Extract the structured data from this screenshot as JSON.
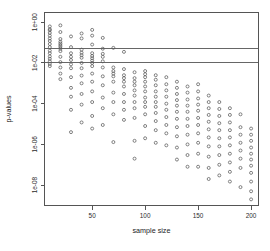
{
  "chart_data": {
    "type": "scatter",
    "title": "",
    "xlabel": "sample size",
    "ylabel": "p-values",
    "yscale": "log",
    "xlim": [
      5,
      207
    ],
    "ylim": [
      1e-09,
      3.0
    ],
    "grid": false,
    "legend": null,
    "xticks": [
      50,
      100,
      150,
      200
    ],
    "xtick_labels": [
      "50",
      "100",
      "150",
      "200"
    ],
    "yticks": [
      1,
      0.01,
      0.0001,
      1e-06,
      1e-08
    ],
    "ytick_labels": [
      "1e+00",
      "1e-02",
      "1e-04",
      "1e-06",
      "1e-08"
    ],
    "reference_lines": [
      {
        "y": 0.05,
        "label": "",
        "orientation": "horizontal"
      },
      {
        "y": 0.01,
        "label": "",
        "orientation": "horizontal"
      }
    ],
    "marker": {
      "shape": "open-circle",
      "size": 3
    },
    "points": [
      {
        "x": 10,
        "y": 0.62
      },
      {
        "x": 10,
        "y": 0.45
      },
      {
        "x": 10,
        "y": 0.4
      },
      {
        "x": 10,
        "y": 0.3
      },
      {
        "x": 10,
        "y": 0.22
      },
      {
        "x": 10,
        "y": 0.16
      },
      {
        "x": 10,
        "y": 0.12
      },
      {
        "x": 10,
        "y": 0.085
      },
      {
        "x": 10,
        "y": 0.06
      },
      {
        "x": 10,
        "y": 0.04
      },
      {
        "x": 10,
        "y": 0.03
      },
      {
        "x": 10,
        "y": 0.021
      },
      {
        "x": 10,
        "y": 0.016
      },
      {
        "x": 10,
        "y": 0.012
      },
      {
        "x": 10,
        "y": 0.009
      },
      {
        "x": 10,
        "y": 0.007
      },
      {
        "x": 20,
        "y": 0.7
      },
      {
        "x": 20,
        "y": 0.33
      },
      {
        "x": 20,
        "y": 0.15
      },
      {
        "x": 20,
        "y": 0.11
      },
      {
        "x": 20,
        "y": 0.09
      },
      {
        "x": 20,
        "y": 0.075
      },
      {
        "x": 20,
        "y": 0.062
      },
      {
        "x": 20,
        "y": 0.05
      },
      {
        "x": 20,
        "y": 0.038
      },
      {
        "x": 20,
        "y": 0.02
      },
      {
        "x": 20,
        "y": 0.011
      },
      {
        "x": 20,
        "y": 0.006
      },
      {
        "x": 20,
        "y": 0.003
      },
      {
        "x": 20,
        "y": 0.0016
      },
      {
        "x": 30,
        "y": 0.2
      },
      {
        "x": 30,
        "y": 0.06
      },
      {
        "x": 30,
        "y": 0.03
      },
      {
        "x": 30,
        "y": 0.02
      },
      {
        "x": 30,
        "y": 0.014
      },
      {
        "x": 30,
        "y": 0.0085
      },
      {
        "x": 30,
        "y": 0.0055
      },
      {
        "x": 30,
        "y": 0.002
      },
      {
        "x": 30,
        "y": 0.0006
      },
      {
        "x": 30,
        "y": 0.00022
      },
      {
        "x": 30,
        "y": 5e-05
      },
      {
        "x": 30,
        "y": 4e-06
      },
      {
        "x": 40,
        "y": 0.28
      },
      {
        "x": 40,
        "y": 0.16
      },
      {
        "x": 40,
        "y": 0.045
      },
      {
        "x": 40,
        "y": 0.032
      },
      {
        "x": 40,
        "y": 0.024
      },
      {
        "x": 40,
        "y": 0.018
      },
      {
        "x": 40,
        "y": 0.01
      },
      {
        "x": 40,
        "y": 0.0055
      },
      {
        "x": 40,
        "y": 0.0024
      },
      {
        "x": 40,
        "y": 0.001
      },
      {
        "x": 40,
        "y": 0.0003
      },
      {
        "x": 40,
        "y": 9e-05
      },
      {
        "x": 40,
        "y": 1.2e-05
      },
      {
        "x": 50,
        "y": 0.42
      },
      {
        "x": 50,
        "y": 0.22
      },
      {
        "x": 50,
        "y": 0.08
      },
      {
        "x": 50,
        "y": 0.03
      },
      {
        "x": 50,
        "y": 0.022
      },
      {
        "x": 50,
        "y": 0.017
      },
      {
        "x": 50,
        "y": 0.013
      },
      {
        "x": 50,
        "y": 0.01
      },
      {
        "x": 50,
        "y": 0.007
      },
      {
        "x": 50,
        "y": 0.003
      },
      {
        "x": 50,
        "y": 0.0012
      },
      {
        "x": 50,
        "y": 0.0004
      },
      {
        "x": 50,
        "y": 0.00012
      },
      {
        "x": 50,
        "y": 2.5e-05
      },
      {
        "x": 50,
        "y": 6e-06
      },
      {
        "x": 60,
        "y": 0.17
      },
      {
        "x": 60,
        "y": 0.05
      },
      {
        "x": 60,
        "y": 0.028
      },
      {
        "x": 60,
        "y": 0.02
      },
      {
        "x": 60,
        "y": 0.012
      },
      {
        "x": 60,
        "y": 0.006
      },
      {
        "x": 60,
        "y": 0.0022
      },
      {
        "x": 60,
        "y": 0.0008
      },
      {
        "x": 60,
        "y": 0.0002
      },
      {
        "x": 60,
        "y": 6e-05
      },
      {
        "x": 60,
        "y": 9e-06
      },
      {
        "x": 70,
        "y": 0.055
      },
      {
        "x": 70,
        "y": 0.006
      },
      {
        "x": 70,
        "y": 0.004
      },
      {
        "x": 70,
        "y": 0.003
      },
      {
        "x": 70,
        "y": 0.0022
      },
      {
        "x": 70,
        "y": 0.0012
      },
      {
        "x": 70,
        "y": 0.00035
      },
      {
        "x": 70,
        "y": 0.00012
      },
      {
        "x": 70,
        "y": 3e-05
      },
      {
        "x": 70,
        "y": 1.3e-06
      },
      {
        "x": 80,
        "y": 0.035
      },
      {
        "x": 80,
        "y": 0.005
      },
      {
        "x": 80,
        "y": 0.0025
      },
      {
        "x": 80,
        "y": 0.0018
      },
      {
        "x": 80,
        "y": 0.0012
      },
      {
        "x": 80,
        "y": 0.0007
      },
      {
        "x": 80,
        "y": 0.0003
      },
      {
        "x": 80,
        "y": 0.00012
      },
      {
        "x": 80,
        "y": 5e-05
      },
      {
        "x": 80,
        "y": 1.6e-05
      },
      {
        "x": 90,
        "y": 0.0035
      },
      {
        "x": 90,
        "y": 0.0018
      },
      {
        "x": 90,
        "y": 0.0012
      },
      {
        "x": 90,
        "y": 0.0008
      },
      {
        "x": 90,
        "y": 0.00045
      },
      {
        "x": 90,
        "y": 0.00025
      },
      {
        "x": 90,
        "y": 0.00012
      },
      {
        "x": 90,
        "y": 6e-05
      },
      {
        "x": 90,
        "y": 2e-05
      },
      {
        "x": 90,
        "y": 1.5e-06
      },
      {
        "x": 90,
        "y": 2e-07
      },
      {
        "x": 100,
        "y": 0.004
      },
      {
        "x": 100,
        "y": 0.0028
      },
      {
        "x": 100,
        "y": 0.002
      },
      {
        "x": 100,
        "y": 0.0012
      },
      {
        "x": 100,
        "y": 0.0007
      },
      {
        "x": 100,
        "y": 0.0004
      },
      {
        "x": 100,
        "y": 0.0002
      },
      {
        "x": 100,
        "y": 0.00012
      },
      {
        "x": 100,
        "y": 7e-05
      },
      {
        "x": 100,
        "y": 3e-05
      },
      {
        "x": 100,
        "y": 8e-06
      },
      {
        "x": 100,
        "y": 2e-06
      },
      {
        "x": 110,
        "y": 0.0025
      },
      {
        "x": 110,
        "y": 0.0015
      },
      {
        "x": 110,
        "y": 0.0008
      },
      {
        "x": 110,
        "y": 0.0004
      },
      {
        "x": 110,
        "y": 0.00022
      },
      {
        "x": 110,
        "y": 0.00012
      },
      {
        "x": 110,
        "y": 7e-05
      },
      {
        "x": 110,
        "y": 3.5e-05
      },
      {
        "x": 110,
        "y": 1.4e-05
      },
      {
        "x": 110,
        "y": 5e-06
      },
      {
        "x": 110,
        "y": 1.2e-06
      },
      {
        "x": 120,
        "y": 0.002
      },
      {
        "x": 120,
        "y": 0.0009
      },
      {
        "x": 120,
        "y": 0.00045
      },
      {
        "x": 120,
        "y": 0.00022
      },
      {
        "x": 120,
        "y": 0.0001
      },
      {
        "x": 120,
        "y": 5e-05
      },
      {
        "x": 120,
        "y": 2.2e-05
      },
      {
        "x": 120,
        "y": 9e-06
      },
      {
        "x": 120,
        "y": 3.5e-06
      },
      {
        "x": 120,
        "y": 9e-07
      },
      {
        "x": 130,
        "y": 0.0012
      },
      {
        "x": 130,
        "y": 0.0006
      },
      {
        "x": 130,
        "y": 0.0003
      },
      {
        "x": 130,
        "y": 0.00015
      },
      {
        "x": 130,
        "y": 8e-05
      },
      {
        "x": 130,
        "y": 4e-05
      },
      {
        "x": 130,
        "y": 1.8e-05
      },
      {
        "x": 130,
        "y": 7e-06
      },
      {
        "x": 130,
        "y": 2.5e-06
      },
      {
        "x": 130,
        "y": 7e-07
      },
      {
        "x": 130,
        "y": 1.8e-07
      },
      {
        "x": 140,
        "y": 0.0007
      },
      {
        "x": 140,
        "y": 0.00035
      },
      {
        "x": 140,
        "y": 0.00016
      },
      {
        "x": 140,
        "y": 8e-05
      },
      {
        "x": 140,
        "y": 4e-05
      },
      {
        "x": 140,
        "y": 1.8e-05
      },
      {
        "x": 140,
        "y": 8e-06
      },
      {
        "x": 140,
        "y": 3e-06
      },
      {
        "x": 140,
        "y": 1e-06
      },
      {
        "x": 140,
        "y": 3e-07
      },
      {
        "x": 140,
        "y": 8e-08
      },
      {
        "x": 150,
        "y": 0.0009
      },
      {
        "x": 150,
        "y": 0.0004
      },
      {
        "x": 150,
        "y": 0.00018
      },
      {
        "x": 150,
        "y": 9e-05
      },
      {
        "x": 150,
        "y": 4.5e-05
      },
      {
        "x": 150,
        "y": 2e-05
      },
      {
        "x": 150,
        "y": 9e-06
      },
      {
        "x": 150,
        "y": 3.5e-06
      },
      {
        "x": 150,
        "y": 1.2e-06
      },
      {
        "x": 150,
        "y": 3.5e-07
      },
      {
        "x": 150,
        "y": 8e-08
      },
      {
        "x": 160,
        "y": 0.00025
      },
      {
        "x": 160,
        "y": 0.00012
      },
      {
        "x": 160,
        "y": 6e-05
      },
      {
        "x": 160,
        "y": 2.8e-05
      },
      {
        "x": 160,
        "y": 1.3e-05
      },
      {
        "x": 160,
        "y": 5.5e-06
      },
      {
        "x": 160,
        "y": 2.2e-06
      },
      {
        "x": 160,
        "y": 8e-07
      },
      {
        "x": 160,
        "y": 2.5e-07
      },
      {
        "x": 160,
        "y": 7e-08
      },
      {
        "x": 160,
        "y": 2e-08
      },
      {
        "x": 170,
        "y": 0.00012
      },
      {
        "x": 170,
        "y": 5.5e-05
      },
      {
        "x": 170,
        "y": 2.5e-05
      },
      {
        "x": 170,
        "y": 1.1e-05
      },
      {
        "x": 170,
        "y": 5e-06
      },
      {
        "x": 170,
        "y": 2e-06
      },
      {
        "x": 170,
        "y": 8e-07
      },
      {
        "x": 170,
        "y": 3e-07
      },
      {
        "x": 170,
        "y": 1e-07
      },
      {
        "x": 170,
        "y": 3e-08
      },
      {
        "x": 180,
        "y": 6e-05
      },
      {
        "x": 180,
        "y": 2.8e-05
      },
      {
        "x": 180,
        "y": 1.2e-05
      },
      {
        "x": 180,
        "y": 5e-06
      },
      {
        "x": 180,
        "y": 2.2e-06
      },
      {
        "x": 180,
        "y": 9e-07
      },
      {
        "x": 180,
        "y": 3.5e-07
      },
      {
        "x": 180,
        "y": 1.3e-07
      },
      {
        "x": 180,
        "y": 4.5e-08
      },
      {
        "x": 180,
        "y": 1.5e-08
      },
      {
        "x": 190,
        "y": 3e-05
      },
      {
        "x": 190,
        "y": 7e-06
      },
      {
        "x": 190,
        "y": 3e-06
      },
      {
        "x": 190,
        "y": 1.2e-06
      },
      {
        "x": 190,
        "y": 5e-07
      },
      {
        "x": 190,
        "y": 2e-07
      },
      {
        "x": 190,
        "y": 7e-08
      },
      {
        "x": 190,
        "y": 8e-09
      },
      {
        "x": 200,
        "y": 6e-06
      },
      {
        "x": 200,
        "y": 3e-06
      },
      {
        "x": 200,
        "y": 1.5e-06
      },
      {
        "x": 200,
        "y": 7e-07
      },
      {
        "x": 200,
        "y": 3.5e-07
      },
      {
        "x": 200,
        "y": 1.8e-07
      },
      {
        "x": 200,
        "y": 9e-08
      },
      {
        "x": 200,
        "y": 4e-08
      },
      {
        "x": 200,
        "y": 1.5e-08
      },
      {
        "x": 200,
        "y": 5e-09
      },
      {
        "x": 200,
        "y": 2e-09
      }
    ]
  }
}
